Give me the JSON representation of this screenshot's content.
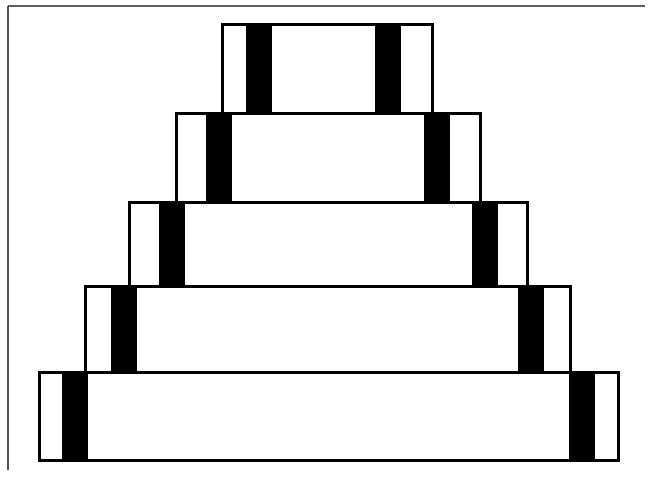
{
  "figure": {
    "width": 652,
    "height": 494,
    "background_color": "#ffffff",
    "outline_color": "#000000",
    "bar_color": "#000000",
    "fill_color": "#ffffff",
    "frame_color": "#2b2b2b",
    "tier_count": 5,
    "bars_per_tier": 2
  },
  "frame": {
    "name": "partial-border",
    "left_line": {
      "x": 8,
      "y1": 6,
      "y2": 470
    },
    "top_line": {
      "y": 6,
      "x1": 8,
      "x2": 645
    },
    "stroke_width": 1.6
  },
  "chart_data": {
    "type": "diagram",
    "xlabel": "",
    "ylabel": "",
    "grid": false,
    "legend": null,
    "units": "pixels",
    "tiers": [
      {
        "index": 1,
        "name": "tier-top",
        "x": 222,
        "y": 24,
        "width": 210,
        "height": 90,
        "bars": [
          {
            "x": 246,
            "width": 26
          },
          {
            "x": 375,
            "width": 26
          }
        ]
      },
      {
        "index": 2,
        "name": "tier-second",
        "x": 176,
        "y": 113,
        "width": 304,
        "height": 90,
        "bars": [
          {
            "x": 206,
            "width": 26
          },
          {
            "x": 424,
            "width": 26
          }
        ]
      },
      {
        "index": 3,
        "name": "tier-middle",
        "x": 129,
        "y": 202,
        "width": 398,
        "height": 86,
        "bars": [
          {
            "x": 159,
            "width": 26
          },
          {
            "x": 472,
            "width": 26
          }
        ]
      },
      {
        "index": 4,
        "name": "tier-fourth",
        "x": 85,
        "y": 286,
        "width": 485,
        "height": 88,
        "bars": [
          {
            "x": 111,
            "width": 26
          },
          {
            "x": 518,
            "width": 26
          }
        ]
      },
      {
        "index": 5,
        "name": "tier-bottom",
        "x": 39,
        "y": 372,
        "width": 579,
        "height": 88,
        "bars": [
          {
            "x": 62,
            "width": 26
          },
          {
            "x": 569,
            "width": 26
          }
        ]
      }
    ]
  }
}
